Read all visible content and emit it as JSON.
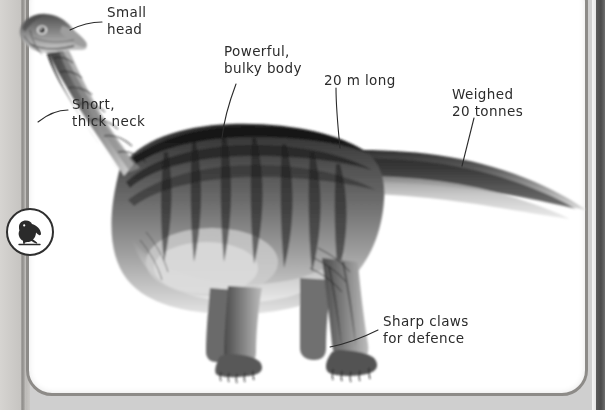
{
  "page": {
    "background_color": "#cfcfcf",
    "panel_color": "#ffffff",
    "panel_border_color": "#8d8b88",
    "ink_color": "#2b2b2b"
  },
  "badge": {
    "icon_name": "dinosaur-icon",
    "alt": "dinosaur silhouette badge"
  },
  "illustration": {
    "name": "sauropod-dinosaur-illustration",
    "subject": "sauropod dinosaur",
    "description": "Greyscale pencil illustration of a long-necked, long-tailed sauropod dinosaur facing left"
  },
  "annotations": [
    {
      "id": "small-head",
      "text": "Small\nhead",
      "target": "head"
    },
    {
      "id": "short-thick-neck",
      "text": "Short,\nthick neck",
      "target": "neck"
    },
    {
      "id": "powerful-bulky-body",
      "text": "Powerful,\nbulky body",
      "target": "body"
    },
    {
      "id": "twenty-metres-long",
      "text": "20 m long",
      "target": "back"
    },
    {
      "id": "weighed-twenty-tonnes",
      "text": "Weighed\n20 tonnes",
      "target": "tail"
    },
    {
      "id": "sharp-claws-for-defence",
      "text": "Sharp claws\nfor defence",
      "target": "front-foot"
    }
  ]
}
